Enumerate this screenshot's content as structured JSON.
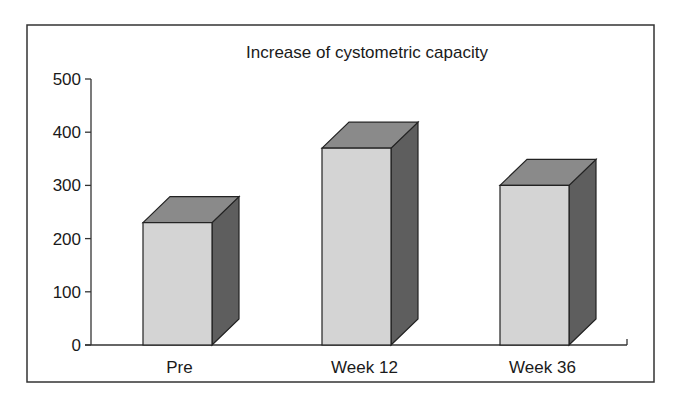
{
  "chart_data": {
    "type": "bar",
    "style": "3d",
    "title": "Increase of cystometric capacity",
    "xlabel": "",
    "ylabel": "",
    "categories": [
      "Pre",
      "Week 12",
      "Week 36"
    ],
    "values": [
      230,
      370,
      300
    ],
    "ylim": [
      0,
      500
    ],
    "yticks": [
      0,
      100,
      200,
      300,
      400,
      500
    ],
    "grid": false,
    "legend": null,
    "colors": {
      "front": "#d4d4d4",
      "top": "#8a8a8a",
      "side": "#5e5e5e",
      "edge": "#222222"
    }
  }
}
